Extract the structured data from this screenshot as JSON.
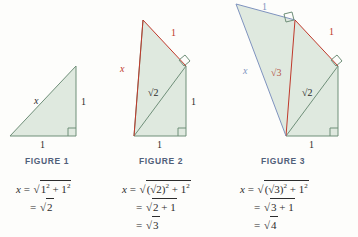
{
  "page": {
    "background_color": "#fdfdfb",
    "triangle_fill": "#dfe9df",
    "green_stroke": "#6f8f79",
    "red_stroke": "#c0392b",
    "blue_stroke": "#7f93bf",
    "caption_color": "#51607a",
    "text_color": "#2c2c2c"
  },
  "figures": [
    {
      "caption": "FIGURE 1",
      "labels": {
        "hypotenuse": "x",
        "vertical_side": "1",
        "horizontal_side": "1"
      },
      "label_colors": {
        "hypotenuse": "#2c2c2c",
        "vertical_side": "#2c2c2c",
        "horizontal_side": "#2c2c2c"
      },
      "right_angle_marks": 1
    },
    {
      "caption": "FIGURE 2",
      "labels": {
        "hypotenuse": "x",
        "new_side": "1",
        "inner_diagonal": "√2",
        "vertical_side": "1",
        "horizontal_side": "1"
      },
      "label_colors": {
        "hypotenuse": "#c0392b",
        "new_side": "#c0392b",
        "inner_diagonal": "#2c2c2c",
        "vertical_side": "#2c2c2c",
        "horizontal_side": "#2c2c2c"
      },
      "right_angle_marks": 2
    },
    {
      "caption": "FIGURE 3",
      "labels": {
        "hypotenuse": "x",
        "top_side": "1",
        "inner_red": "√3",
        "right_side": "1",
        "inner_diagonal": "√2",
        "horizontal_side": "1"
      },
      "label_colors": {
        "hypotenuse": "#7f93bf",
        "top_side": "#7f93bf",
        "inner_red": "#b5564a",
        "right_side": "#c0392b",
        "inner_diagonal": "#2c2c2c",
        "horizontal_side": "#2c2c2c"
      },
      "right_angle_marks": 3
    }
  ],
  "equations": [
    {
      "lines": [
        {
          "lhs": "x",
          "eq": "=",
          "radicand": "1² + 1²",
          "plain": "x = √(1² + 1²)"
        },
        {
          "lhs": "",
          "eq": "=",
          "radicand": "2",
          "plain": "= √2"
        }
      ]
    },
    {
      "lines": [
        {
          "lhs": "x",
          "eq": "=",
          "radicand": "(√2)² + 1²",
          "plain": "x = √((√2)² + 1²)"
        },
        {
          "lhs": "",
          "eq": "=",
          "radicand": "2 + 1",
          "plain": "= √(2 + 1)"
        },
        {
          "lhs": "",
          "eq": "=",
          "radicand": "3",
          "plain": "= √3"
        }
      ]
    },
    {
      "lines": [
        {
          "lhs": "x",
          "eq": "=",
          "radicand": "(√3)² + 1²",
          "plain": "x = √((√3)² + 1²)"
        },
        {
          "lhs": "",
          "eq": "=",
          "radicand": "3 + 1",
          "plain": "= √(3 + 1)"
        },
        {
          "lhs": "",
          "eq": "=",
          "radicand": "4",
          "plain": "= √4"
        }
      ]
    }
  ]
}
